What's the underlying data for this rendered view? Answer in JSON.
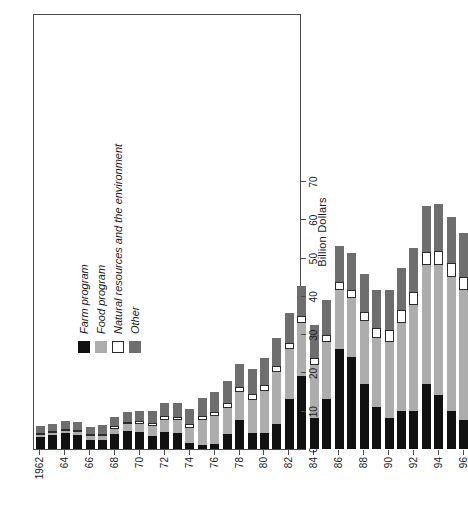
{
  "chart_data": {
    "type": "bar",
    "subtype": "stacked-horizontal-bar",
    "title": "",
    "xlabel": "",
    "ylabel": "Billion Dollars",
    "value_axis_title": "Billion Dollars",
    "ylim": [
      0,
      70
    ],
    "value_ticks": [
      0,
      10,
      20,
      30,
      40,
      50,
      60,
      70
    ],
    "grid": false,
    "orientation": "rotated-90-ccw",
    "legend_position": "inside-upper-left",
    "categories": [
      "1962",
      "63",
      "64",
      "65",
      "66",
      "67",
      "68",
      "69",
      "70",
      "71",
      "72",
      "73",
      "74",
      "75",
      "76",
      "77",
      "78",
      "79",
      "80",
      "81",
      "82",
      "83",
      "84",
      "85",
      "86",
      "87",
      "88",
      "89",
      "90",
      "91",
      "92",
      "93",
      "94",
      "95",
      "96"
    ],
    "category_tick_labels": [
      "1962",
      "",
      "64",
      "",
      "66",
      "",
      "68",
      "",
      "70",
      "",
      "72",
      "",
      "74",
      "",
      "76",
      "",
      "78",
      "",
      "80",
      "",
      "82",
      "",
      "84",
      "",
      "86",
      "",
      "88",
      "",
      "90",
      "",
      "92",
      "",
      "94",
      "",
      "96"
    ],
    "series": [
      {
        "name": "Farm program",
        "color": "#111111",
        "values": [
          3.2,
          3.6,
          4.2,
          3.7,
          2.4,
          2.4,
          3.9,
          4.8,
          4.5,
          3.5,
          4.5,
          4.2,
          1.5,
          1.0,
          1.3,
          3.8,
          7.5,
          4.3,
          4.3,
          6.5,
          13.0,
          19.0,
          8.0,
          13.0,
          26.0,
          24.0,
          17.0,
          11.0,
          8.0,
          10.0,
          10.0,
          17.0,
          14.0,
          10.0,
          7.5
        ]
      },
      {
        "name": "Food program",
        "color": "#adadad",
        "values": [
          0.5,
          0.6,
          0.6,
          0.8,
          0.9,
          1.1,
          1.4,
          1.6,
          2.0,
          2.6,
          3.2,
          3.3,
          4.0,
          6.5,
          7.2,
          7.0,
          7.3,
          8.5,
          10.8,
          13.5,
          13.0,
          14.0,
          14.0,
          15.0,
          15.5,
          15.5,
          16.5,
          18.0,
          20.0,
          23.0,
          27.5,
          31.0,
          34.0,
          35.0,
          34.0
        ]
      },
      {
        "name": "Natural resources and the environment",
        "color": "#ffffff",
        "values": [
          0.4,
          0.4,
          0.4,
          0.5,
          0.5,
          0.5,
          0.6,
          0.6,
          0.7,
          0.7,
          0.8,
          0.9,
          1.0,
          1.1,
          1.2,
          1.3,
          1.4,
          1.5,
          1.6,
          1.6,
          1.7,
          1.7,
          1.8,
          1.9,
          2.0,
          2.1,
          2.3,
          2.6,
          3.0,
          3.2,
          3.4,
          3.5,
          3.6,
          3.5,
          3.4
        ]
      },
      {
        "name": "Other",
        "color": "#6e6e6e",
        "values": [
          2.0,
          2.0,
          2.1,
          2.0,
          2.0,
          2.2,
          2.4,
          2.6,
          2.8,
          3.0,
          3.4,
          3.6,
          4.0,
          4.6,
          5.2,
          5.6,
          6.0,
          6.5,
          7.2,
          7.5,
          7.8,
          8.0,
          8.5,
          9.0,
          9.5,
          9.5,
          9.8,
          10.0,
          10.5,
          11.0,
          11.5,
          12.0,
          12.5,
          12.0,
          11.5
        ]
      }
    ],
    "totals": [
      6.1,
      6.6,
      7.3,
      7.0,
      5.8,
      6.2,
      8.3,
      9.6,
      10.0,
      9.8,
      11.9,
      12.0,
      10.5,
      13.2,
      14.9,
      17.7,
      22.2,
      20.8,
      23.9,
      29.1,
      35.5,
      42.7,
      32.3,
      38.9,
      53.0,
      51.1,
      45.6,
      41.6,
      41.5,
      47.2,
      52.4,
      63.5,
      64.1,
      60.5,
      56.4
    ]
  },
  "legend": {
    "items": [
      {
        "label": "Farm program",
        "color": "#111111",
        "swatch": "solid-black-swatch"
      },
      {
        "label": "Food program",
        "color": "#adadad",
        "swatch": "light-gray-swatch"
      },
      {
        "label": "Natural resources and the environment",
        "color": "#ffffff",
        "swatch": "white-swatch"
      },
      {
        "label": "Other",
        "color": "#6e6e6e",
        "swatch": "mid-gray-swatch"
      }
    ]
  }
}
